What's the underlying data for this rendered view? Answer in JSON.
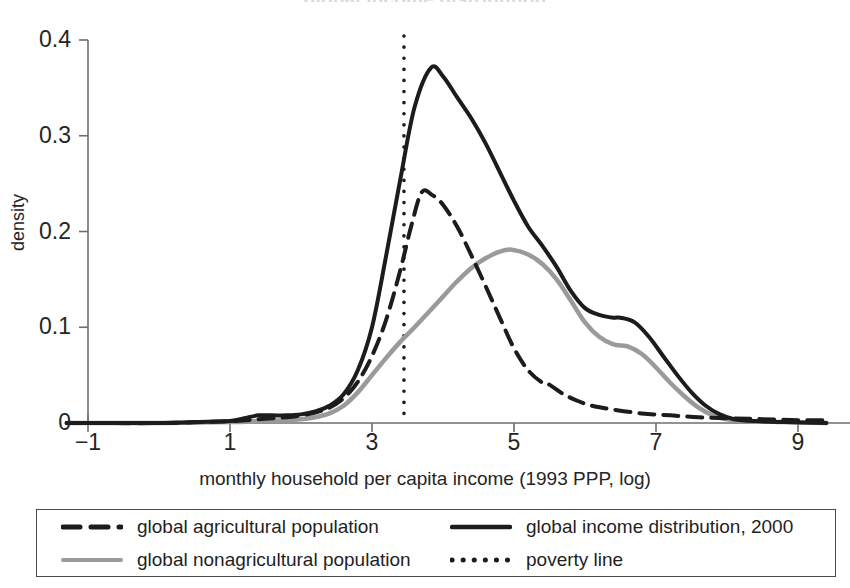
{
  "figure": {
    "clipped_title_fragment": "global income distribution",
    "ylabel": "density",
    "xlabel": "monthly household per capita income (1993 PPP, log)"
  },
  "axes": {
    "y_ticks": [
      "0",
      "0.1",
      "0.2",
      "0.3",
      "0.4"
    ],
    "x_ticks": [
      "−1",
      "1",
      "3",
      "5",
      "7",
      "9"
    ]
  },
  "legend": {
    "items": [
      {
        "label": "global agricultural population",
        "style": "dashed",
        "color": "#1c1c1c"
      },
      {
        "label": "global income distribution, 2000",
        "style": "solid",
        "color": "#1c1c1c"
      },
      {
        "label": "global nonagricultural population",
        "style": "solid",
        "color": "#9a9a9a"
      },
      {
        "label": "poverty line",
        "style": "dotted",
        "color": "#1c1c1c"
      }
    ]
  },
  "annotations": {
    "poverty_line_x": 3.45
  },
  "chart_data": {
    "type": "line",
    "title": "",
    "xlabel": "monthly household per capita income (1993 PPP, log)",
    "ylabel": "density",
    "xlim": [
      -1.3,
      9.4
    ],
    "ylim": [
      0,
      0.4
    ],
    "xticks": [
      -1,
      1,
      3,
      5,
      7,
      9
    ],
    "yticks": [
      0,
      0.1,
      0.2,
      0.3,
      0.4
    ],
    "grid": false,
    "legend_position": "below-axes",
    "annotations": [
      {
        "kind": "vline",
        "label": "poverty line",
        "x": 3.45,
        "style": "dotted",
        "color": "#1c1c1c"
      }
    ],
    "series": [
      {
        "name": "global income distribution, 2000",
        "style": "solid",
        "color": "#1c1c1c",
        "width": 4,
        "x": [
          -1.3,
          -1.0,
          -0.5,
          0.0,
          0.5,
          1.0,
          1.2,
          1.4,
          1.6,
          1.8,
          2.0,
          2.2,
          2.4,
          2.6,
          2.8,
          3.0,
          3.2,
          3.4,
          3.6,
          3.83,
          4.0,
          4.2,
          4.4,
          4.6,
          4.8,
          5.0,
          5.2,
          5.4,
          5.6,
          5.8,
          6.0,
          6.2,
          6.4,
          6.5,
          6.7,
          6.9,
          7.1,
          7.3,
          7.5,
          7.7,
          7.9,
          8.1,
          8.4,
          8.8,
          9.4
        ],
        "y": [
          0.0,
          0.0,
          0.0,
          0.0,
          0.001,
          0.002,
          0.005,
          0.008,
          0.008,
          0.008,
          0.009,
          0.012,
          0.018,
          0.03,
          0.055,
          0.1,
          0.175,
          0.255,
          0.33,
          0.371,
          0.362,
          0.34,
          0.318,
          0.292,
          0.262,
          0.232,
          0.205,
          0.185,
          0.163,
          0.138,
          0.12,
          0.113,
          0.11,
          0.11,
          0.105,
          0.09,
          0.07,
          0.05,
          0.032,
          0.018,
          0.009,
          0.004,
          0.002,
          0.001,
          0.0
        ]
      },
      {
        "name": "global agricultural population",
        "style": "dashed",
        "color": "#1c1c1c",
        "width": 4,
        "x": [
          -1.3,
          -1.0,
          0.0,
          1.0,
          1.4,
          1.8,
          2.0,
          2.2,
          2.4,
          2.6,
          2.8,
          3.0,
          3.2,
          3.4,
          3.55,
          3.7,
          3.85,
          4.0,
          4.2,
          4.4,
          4.6,
          4.8,
          5.0,
          5.2,
          5.4,
          5.5,
          5.7,
          5.9,
          6.1,
          6.4,
          6.8,
          7.2,
          7.6,
          8.0,
          8.5,
          9.0,
          9.4
        ],
        "y": [
          0.0,
          0.0,
          0.0,
          0.002,
          0.004,
          0.006,
          0.008,
          0.011,
          0.016,
          0.026,
          0.043,
          0.07,
          0.108,
          0.16,
          0.205,
          0.241,
          0.238,
          0.228,
          0.205,
          0.175,
          0.143,
          0.11,
          0.078,
          0.055,
          0.042,
          0.04,
          0.03,
          0.023,
          0.018,
          0.014,
          0.01,
          0.008,
          0.006,
          0.005,
          0.004,
          0.003,
          0.003
        ]
      },
      {
        "name": "global nonagricultural population",
        "style": "solid",
        "color": "#9a9a9a",
        "width": 4.5,
        "x": [
          -1.3,
          -1.0,
          0.0,
          1.0,
          1.4,
          1.8,
          2.0,
          2.2,
          2.4,
          2.6,
          2.8,
          3.0,
          3.2,
          3.4,
          3.6,
          3.8,
          4.0,
          4.2,
          4.4,
          4.6,
          4.8,
          4.97,
          5.2,
          5.4,
          5.6,
          5.8,
          6.0,
          6.2,
          6.4,
          6.6,
          6.8,
          7.0,
          7.2,
          7.4,
          7.6,
          7.8,
          8.0,
          8.3,
          8.8,
          9.4
        ],
        "y": [
          0.0,
          0.0,
          0.0,
          0.001,
          0.002,
          0.003,
          0.004,
          0.006,
          0.01,
          0.018,
          0.032,
          0.05,
          0.068,
          0.085,
          0.1,
          0.116,
          0.132,
          0.148,
          0.162,
          0.172,
          0.179,
          0.181,
          0.176,
          0.166,
          0.15,
          0.128,
          0.105,
          0.09,
          0.082,
          0.08,
          0.072,
          0.058,
          0.042,
          0.028,
          0.016,
          0.008,
          0.004,
          0.002,
          0.001,
          0.0
        ]
      }
    ]
  }
}
